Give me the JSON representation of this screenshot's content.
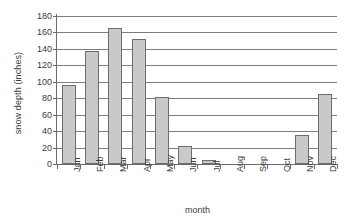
{
  "chart_data": {
    "type": "bar",
    "title": "",
    "xlabel": "month",
    "ylabel": "snow depth (inches)",
    "categories": [
      "Jan",
      "Feb",
      "Mar",
      "Apr",
      "May",
      "Jun",
      "Jul",
      "Aug",
      "Sep",
      "Oct",
      "Nov",
      "Dec"
    ],
    "values": [
      96,
      137,
      166,
      152,
      82,
      22,
      5,
      0,
      0,
      0,
      35,
      85
    ],
    "ylim": [
      0,
      180
    ],
    "yticks": [
      0,
      20,
      40,
      60,
      80,
      100,
      120,
      140,
      160,
      180
    ],
    "ytick_labels": [
      "0",
      "20",
      "40",
      "60",
      "80",
      "100",
      "120",
      "140",
      "160",
      "180"
    ],
    "grid": true,
    "legend": false,
    "series_name": "snow depth",
    "bar_fill_color": "#c9c9c9",
    "bar_border_color": "#6d6d6d",
    "gridline_color": "#7d7d7d",
    "axis_color": "#6b6b6b",
    "background_color": "#ffffff",
    "text_color": "#3a3a3a"
  }
}
